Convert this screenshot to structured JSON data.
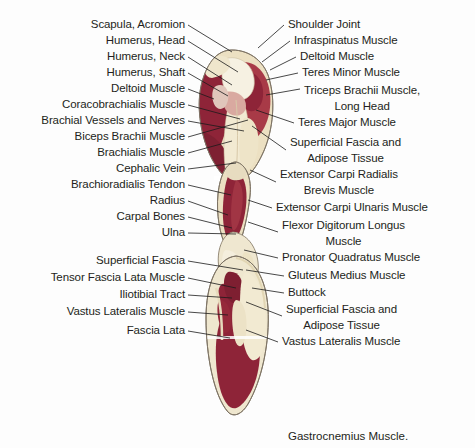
{
  "figure": {
    "background_color": "#fdfdfd",
    "caption": "Gastrocnemius Muscle.",
    "colors": {
      "lean_dark_red": "#8e2438",
      "lean_mid_red": "#a83a47",
      "lean_light_red": "#c06a6c",
      "fat_cream": "#ece0c2",
      "fat_pale": "#f2ead2",
      "bone_white": "#f6f1e2",
      "connective_pink": "#d9a9a0",
      "outline": "#6b6257",
      "text": "#231f20",
      "leader": "#1a1a1a"
    }
  },
  "labels_left": [
    {
      "text": "Scapula, Acromion",
      "x": 185,
      "y": 28,
      "lines": 1
    },
    {
      "text": "Humerus, Head",
      "x": 185,
      "y": 44,
      "lines": 1
    },
    {
      "text": "Humerus, Neck",
      "x": 185,
      "y": 60,
      "lines": 1
    },
    {
      "text": "Humerus, Shaft",
      "x": 185,
      "y": 76,
      "lines": 1
    },
    {
      "text": "Deltoid Muscle",
      "x": 185,
      "y": 92,
      "lines": 1
    },
    {
      "text": "Coracobrachialis Muscle",
      "x": 185,
      "y": 108,
      "lines": 1
    },
    {
      "text": "Brachial Vessels and Nerves",
      "x": 185,
      "y": 124,
      "lines": 1
    },
    {
      "text": "Biceps Brachii Muscle",
      "x": 185,
      "y": 140,
      "lines": 1
    },
    {
      "text": "Brachialis Muscle",
      "x": 185,
      "y": 156,
      "lines": 1
    },
    {
      "text": "Cephalic Vein",
      "x": 185,
      "y": 172,
      "lines": 1
    },
    {
      "text": "Brachioradialis Tendon",
      "x": 185,
      "y": 188,
      "lines": 1
    },
    {
      "text": "Radius",
      "x": 185,
      "y": 204,
      "lines": 1
    },
    {
      "text": "Carpal Bones",
      "x": 185,
      "y": 220,
      "lines": 1
    },
    {
      "text": "Ulna",
      "x": 185,
      "y": 236,
      "lines": 1
    },
    {
      "text": "Superficial Fascia",
      "x": 185,
      "y": 264,
      "lines": 1
    },
    {
      "text": "Tensor Fascia Lata Muscle",
      "x": 185,
      "y": 281,
      "lines": 1
    },
    {
      "text": "Iliotibial Tract",
      "x": 185,
      "y": 298,
      "lines": 1
    },
    {
      "text": "Vastus Lateralis Muscle",
      "x": 185,
      "y": 315,
      "lines": 1
    },
    {
      "text": "Fascia Lata",
      "x": 185,
      "y": 334,
      "lines": 1
    }
  ],
  "labels_right": [
    {
      "text": "Shoulder Joint",
      "x": 288,
      "y": 28,
      "lines": 1
    },
    {
      "text": "Infraspinatus Muscle",
      "x": 294,
      "y": 44,
      "lines": 1
    },
    {
      "text": "Deltoid Muscle",
      "x": 300,
      "y": 60,
      "lines": 1
    },
    {
      "text": "Teres Minor Muscle",
      "x": 302,
      "y": 76,
      "lines": 1
    },
    {
      "text": "Triceps Brachii Muscle,",
      "x": 304,
      "y": 94,
      "lines": 2,
      "line2": "Long Head"
    },
    {
      "text": "Teres Major Muscle",
      "x": 298,
      "y": 126,
      "lines": 1
    },
    {
      "text": "Superficial Fascia and",
      "x": 290,
      "y": 146,
      "lines": 2,
      "line2": "Adipose Tissue"
    },
    {
      "text": "Extensor Carpi Radialis",
      "x": 280,
      "y": 178,
      "lines": 2,
      "line2": "Brevis Muscle"
    },
    {
      "text": "Extensor Carpi Ulnaris Muscle",
      "x": 276,
      "y": 211,
      "lines": 1
    },
    {
      "text": "Flexor Digitorum Longus",
      "x": 282,
      "y": 229,
      "lines": 2,
      "line2": "Muscle"
    },
    {
      "text": "Pronator Quadratus Muscle",
      "x": 282,
      "y": 261,
      "lines": 1
    },
    {
      "text": "Gluteus Medius Muscle",
      "x": 288,
      "y": 279,
      "lines": 1
    },
    {
      "text": "Buttock",
      "x": 288,
      "y": 296,
      "lines": 1
    },
    {
      "text": "Superficial Fascia and",
      "x": 286,
      "y": 313,
      "lines": 2,
      "line2": "Adipose Tissue"
    },
    {
      "text": "Vastus Lateralis Muscle",
      "x": 282,
      "y": 345,
      "lines": 1
    }
  ],
  "leaders_left": [
    {
      "d": "M188,25 L232,52"
    },
    {
      "d": "M188,41 L238,72"
    },
    {
      "d": "M188,57 L232,85"
    },
    {
      "d": "M188,73 L228,96"
    },
    {
      "d": "M188,89 L214,99"
    },
    {
      "d": "M188,105 L240,119"
    },
    {
      "d": "M188,121 L244,131"
    },
    {
      "d": "M188,137 L248,120"
    },
    {
      "d": "M188,153 L232,141"
    },
    {
      "d": "M188,169 L236,163"
    },
    {
      "d": "M188,185 L231,195"
    },
    {
      "d": "M188,201 L228,215"
    },
    {
      "d": "M188,217 L232,228"
    },
    {
      "d": "M188,233 L236,234"
    },
    {
      "d": "M188,261 L243,270"
    },
    {
      "d": "M188,278 L236,288"
    },
    {
      "d": "M188,295 L232,298"
    },
    {
      "d": "M188,312 L228,315"
    },
    {
      "d": "M188,331 L230,338"
    }
  ],
  "leaders_right": [
    {
      "d": "M284,25 L258,48"
    },
    {
      "d": "M290,41 L262,62"
    },
    {
      "d": "M296,57 L270,70"
    },
    {
      "d": "M298,73 L266,80"
    },
    {
      "d": "M300,89 L266,95"
    },
    {
      "d": "M294,123 L256,110"
    },
    {
      "d": "M286,150 L252,126"
    },
    {
      "d": "M276,182 L250,170"
    },
    {
      "d": "M272,208 L248,200"
    },
    {
      "d": "M278,232 L248,222"
    },
    {
      "d": "M278,258 L244,250"
    },
    {
      "d": "M284,276 L246,270"
    },
    {
      "d": "M284,293 L252,288"
    },
    {
      "d": "M282,316 L246,302"
    },
    {
      "d": "M278,342 L246,330"
    }
  ]
}
